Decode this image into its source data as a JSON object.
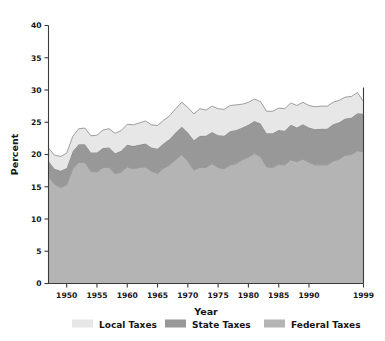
{
  "chart_data": {
    "type": "area",
    "stacked": true,
    "title": "",
    "xlabel": "Year",
    "ylabel": "Percent",
    "xlim": [
      1947,
      1999
    ],
    "ylim": [
      0,
      40
    ],
    "ytick_labels": [
      "0",
      "5",
      "10",
      "15",
      "20",
      "25",
      "30",
      "35",
      "40"
    ],
    "ytick_values": [
      0,
      5,
      10,
      15,
      20,
      25,
      30,
      35,
      40
    ],
    "xtick_labels": [
      "1950",
      "1955",
      "1960",
      "1965",
      "1970",
      "1975",
      "1980",
      "1985",
      "1990",
      "1999"
    ],
    "xtick_values": [
      1950,
      1955,
      1960,
      1965,
      1970,
      1975,
      1980,
      1985,
      1990,
      1999
    ],
    "grid": false,
    "legend_position": "bottom",
    "x": [
      1947,
      1948,
      1949,
      1950,
      1951,
      1952,
      1953,
      1954,
      1955,
      1956,
      1957,
      1958,
      1959,
      1960,
      1961,
      1962,
      1963,
      1964,
      1965,
      1966,
      1967,
      1968,
      1969,
      1970,
      1971,
      1972,
      1973,
      1974,
      1975,
      1976,
      1977,
      1978,
      1979,
      1980,
      1981,
      1982,
      1983,
      1984,
      1985,
      1986,
      1987,
      1988,
      1989,
      1990,
      1991,
      1992,
      1993,
      1994,
      1995,
      1996,
      1997,
      1998,
      1999
    ],
    "series": [
      {
        "name": "Federal Taxes",
        "color": "#b4b4b4",
        "order": 1,
        "values": [
          16.6,
          15.4,
          14.9,
          15.3,
          17.8,
          18.8,
          18.8,
          17.4,
          17.3,
          18.0,
          18.0,
          17.0,
          17.3,
          18.1,
          17.8,
          18.0,
          18.1,
          17.4,
          17.1,
          17.9,
          18.4,
          19.2,
          20.0,
          19.0,
          17.6,
          18.0,
          18.0,
          18.6,
          18.0,
          17.8,
          18.4,
          18.6,
          19.2,
          19.6,
          20.2,
          19.7,
          18.1,
          18.0,
          18.5,
          18.4,
          19.2,
          18.9,
          19.3,
          18.8,
          18.4,
          18.4,
          18.4,
          19.0,
          19.3,
          19.9,
          20.0,
          20.6,
          20.4
        ]
      },
      {
        "name": "State Taxes",
        "color": "#989898",
        "order": 2,
        "values": [
          2.4,
          2.4,
          2.6,
          2.6,
          2.7,
          2.8,
          2.8,
          2.9,
          3.0,
          3.0,
          3.1,
          3.2,
          3.3,
          3.4,
          3.5,
          3.5,
          3.6,
          3.7,
          3.8,
          3.8,
          4.0,
          4.2,
          4.3,
          4.4,
          4.6,
          4.9,
          4.9,
          4.9,
          5.0,
          5.1,
          5.2,
          5.2,
          5.0,
          5.0,
          5.0,
          5.1,
          5.2,
          5.3,
          5.3,
          5.3,
          5.4,
          5.3,
          5.4,
          5.4,
          5.5,
          5.6,
          5.6,
          5.7,
          5.7,
          5.7,
          5.7,
          5.8,
          5.9
        ]
      },
      {
        "name": "Local Taxes",
        "color": "#e7e7e7",
        "order": 3,
        "values": [
          2.0,
          2.1,
          2.2,
          2.3,
          2.3,
          2.4,
          2.5,
          2.6,
          2.7,
          2.8,
          2.9,
          3.1,
          3.1,
          3.2,
          3.3,
          3.4,
          3.5,
          3.5,
          3.6,
          3.6,
          3.6,
          3.7,
          3.8,
          3.9,
          4.1,
          4.2,
          4.0,
          4.0,
          4.1,
          4.1,
          4.0,
          3.9,
          3.6,
          3.5,
          3.4,
          3.4,
          3.4,
          3.4,
          3.4,
          3.4,
          3.4,
          3.4,
          3.4,
          3.4,
          3.5,
          3.5,
          3.5,
          3.4,
          3.4,
          3.3,
          3.3,
          3.2,
          1.9
        ]
      }
    ],
    "totals": [
      21.0,
      19.9,
      19.7,
      20.2,
      22.8,
      24.0,
      24.1,
      22.9,
      23.0,
      23.8,
      24.0,
      23.3,
      23.7,
      24.7,
      24.6,
      24.9,
      25.2,
      24.6,
      24.5,
      25.3,
      26.0,
      27.1,
      28.1,
      27.3,
      26.3,
      27.1,
      26.9,
      27.5,
      27.1,
      27.0,
      27.6,
      27.7,
      27.8,
      28.1,
      28.6,
      28.2,
      26.7,
      26.7,
      27.2,
      27.1,
      28.0,
      27.6,
      28.1,
      27.6,
      27.4,
      27.5,
      27.5,
      28.1,
      28.4,
      28.9,
      29.0,
      29.6,
      28.2
    ]
  },
  "legend": {
    "items": [
      {
        "label": "Local Taxes",
        "color": "#e7e7e7"
      },
      {
        "label": "State Taxes",
        "color": "#989898"
      },
      {
        "label": "Federal Taxes",
        "color": "#b4b4b4"
      }
    ]
  },
  "axes": {
    "y_title": "Percent",
    "x_title": "Year"
  }
}
